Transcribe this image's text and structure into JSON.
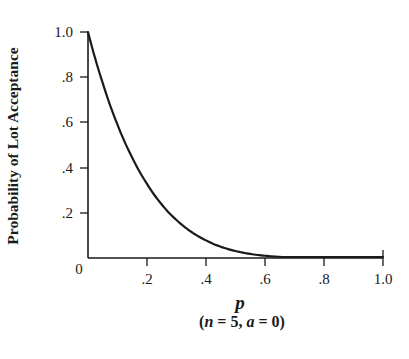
{
  "chart_data": {
    "type": "line",
    "title": "",
    "xlabel": "p",
    "xlabel_subtitle": "(n = 5, a = 0)",
    "ylabel": "Probability of Lot Acceptance",
    "xlim": [
      0,
      1.0
    ],
    "ylim": [
      0,
      1.0
    ],
    "grid": false,
    "legend": null,
    "x_ticks": [
      0,
      0.2,
      0.4,
      0.6,
      0.8,
      1.0
    ],
    "x_tick_labels": [
      "0",
      ".2",
      ".4",
      ".6",
      ".8",
      "1.0"
    ],
    "y_ticks": [
      0.2,
      0.4,
      0.6,
      0.8,
      1.0
    ],
    "y_tick_labels": [
      ".2",
      ".4",
      ".6",
      ".8",
      "1.0"
    ],
    "origin_label": "0",
    "series": [
      {
        "name": "OC curve (1 - p)^5",
        "color": "#1a1a1a",
        "x": [
          0,
          0.05,
          0.1,
          0.15,
          0.2,
          0.25,
          0.3,
          0.35,
          0.4,
          0.45,
          0.5,
          0.55,
          0.6,
          0.65,
          0.7,
          0.75,
          0.8,
          0.85,
          0.9,
          0.95,
          1.0
        ],
        "values": [
          1.0,
          0.774,
          0.59,
          0.444,
          0.328,
          0.237,
          0.168,
          0.116,
          0.078,
          0.05,
          0.031,
          0.018,
          0.01,
          0.005,
          0.002,
          0.001,
          0.0003,
          0.0001,
          0.0,
          0.0,
          0.0
        ]
      }
    ]
  },
  "labels": {
    "y_axis_title": "Probability of Lot Acceptance",
    "x_axis_title": "p",
    "subtitle_open": "(",
    "subtitle_n": "n",
    "subtitle_mid1": " = 5, ",
    "subtitle_a": "a",
    "subtitle_mid2": " = 0)",
    "origin": "0",
    "x_ticks": [
      ".2",
      ".4",
      ".6",
      ".8",
      "1.0"
    ],
    "y_ticks": [
      "1.0",
      ".8",
      ".6",
      ".4",
      ".2"
    ]
  }
}
